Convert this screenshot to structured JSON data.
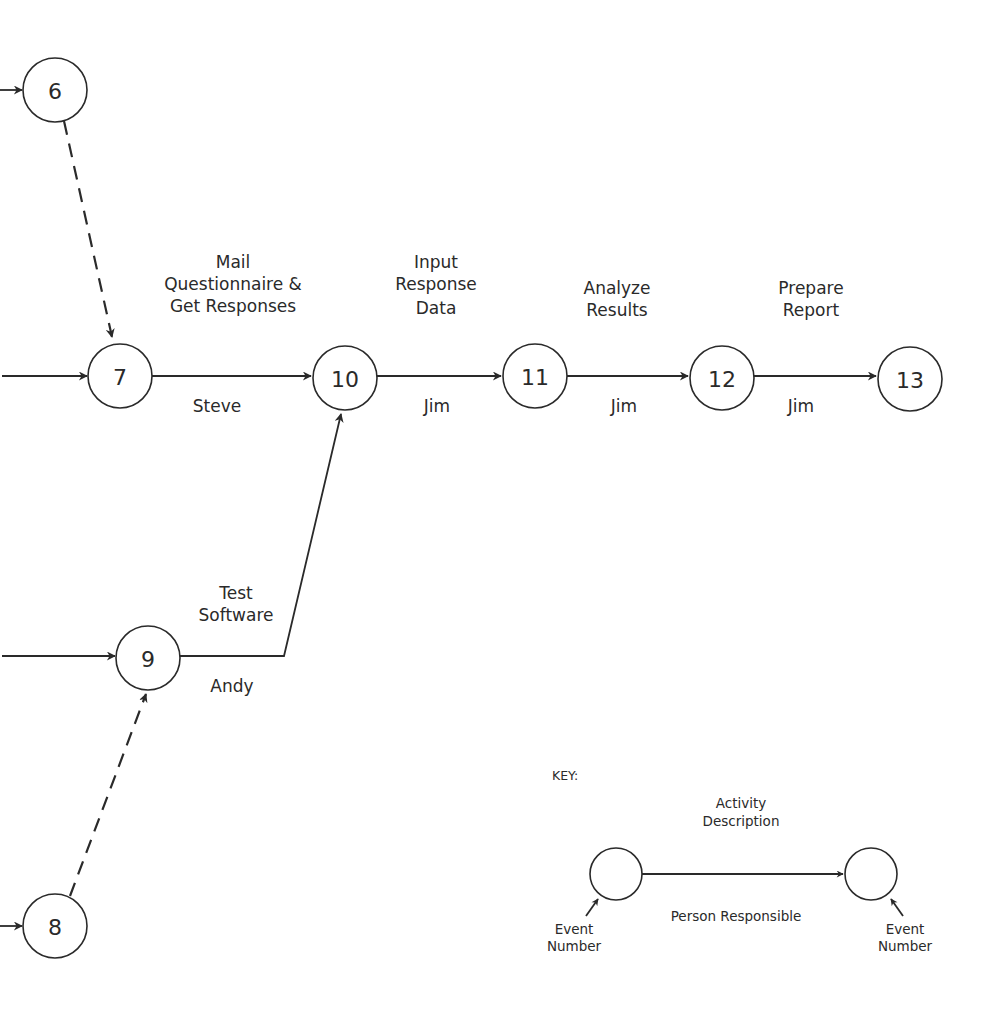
{
  "diagram": {
    "type": "activity-on-arrow network",
    "nodes": [
      {
        "id": "6",
        "label": "6",
        "cx": 55,
        "cy": 90
      },
      {
        "id": "7",
        "label": "7",
        "cx": 120,
        "cy": 376
      },
      {
        "id": "10",
        "label": "10",
        "cx": 345,
        "cy": 378
      },
      {
        "id": "11",
        "label": "11",
        "cx": 535,
        "cy": 376
      },
      {
        "id": "12",
        "label": "12",
        "cx": 722,
        "cy": 378
      },
      {
        "id": "13",
        "label": "13",
        "cx": 910,
        "cy": 379
      },
      {
        "id": "9",
        "label": "9",
        "cx": 148,
        "cy": 658
      },
      {
        "id": "8",
        "label": "8",
        "cx": 55,
        "cy": 926
      }
    ],
    "activities": [
      {
        "from": "7",
        "to": "10",
        "description": [
          "Mail",
          "Questionnaire  &",
          "Get Responses"
        ],
        "person": "Steve"
      },
      {
        "from": "10",
        "to": "11",
        "description": [
          "Input",
          "Response",
          "Data"
        ],
        "person": "Jim"
      },
      {
        "from": "11",
        "to": "12",
        "description": [
          "Analyze",
          "Results"
        ],
        "person": "Jim"
      },
      {
        "from": "12",
        "to": "13",
        "description": [
          "Prepare",
          "Report"
        ],
        "person": "Jim"
      },
      {
        "from": "9",
        "to": "10",
        "description": [
          "Test",
          "Software"
        ],
        "person": "Andy"
      }
    ],
    "dummy_activities": [
      {
        "from": "6",
        "to": "7"
      },
      {
        "from": "8",
        "to": "9"
      }
    ],
    "incoming_from_offpage": [
      "6",
      "7",
      "9",
      "8"
    ]
  },
  "key": {
    "title": "KEY:",
    "activity_description": [
      "Activity",
      "Description"
    ],
    "person_responsible": "Person Responsible",
    "event_number": [
      "Event",
      "Number"
    ]
  },
  "colors": {
    "ink": "#2a2a2a",
    "background": "#ffffff"
  }
}
